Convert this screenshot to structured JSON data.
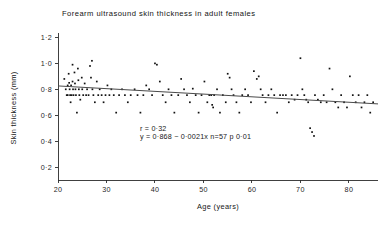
{
  "figure": {
    "title": "Forearm ultrasound skin thickness in adult females",
    "background_color": "#ffffff",
    "ink_color": "#111111"
  },
  "annotations": {
    "line1": "r = 0·32",
    "line2": "y = 0·868 − 0·0021x   n=57  p  0·01"
  },
  "chart_data": {
    "type": "scatter",
    "title": "Forearm ultrasound skin thickness in adult females",
    "xlabel": "Age (years)",
    "ylabel": "Skin thickness (mm)",
    "xlim": [
      20,
      86
    ],
    "ylim": [
      0.1,
      1.25
    ],
    "grid": false,
    "legend": null,
    "xticks": [
      20,
      30,
      40,
      50,
      60,
      70,
      80
    ],
    "xticklabels": [
      "20",
      "30",
      "40",
      "50",
      "60",
      "70",
      "80"
    ],
    "yticks": [
      0.2,
      0.4,
      0.6,
      0.8,
      1.0,
      1.2
    ],
    "yticklabels": [
      "0·2",
      "0·4",
      "0·6",
      "0·8",
      "1·0",
      "1·2"
    ],
    "marker": "dot",
    "n": 57,
    "correlation_r": -0.32,
    "p_value_text": "p 0·01",
    "regression": {
      "intercept": 0.868,
      "slope": -0.0021,
      "equation": "y = 0·868 − 0·0021x",
      "x_start": 20,
      "x_end": 86
    },
    "points": [
      [
        21.3,
        0.88
      ],
      [
        21.6,
        0.8
      ],
      [
        21.8,
        0.755
      ],
      [
        22.0,
        0.83
      ],
      [
        22.0,
        0.755
      ],
      [
        22.2,
        0.92
      ],
      [
        22.3,
        0.85
      ],
      [
        22.4,
        0.8
      ],
      [
        22.5,
        0.755
      ],
      [
        22.6,
        0.7
      ],
      [
        22.7,
        0.83
      ],
      [
        22.8,
        0.755
      ],
      [
        23.0,
        0.99
      ],
      [
        23.0,
        0.86
      ],
      [
        23.1,
        0.8
      ],
      [
        23.2,
        0.755
      ],
      [
        23.4,
        0.93
      ],
      [
        23.5,
        0.845
      ],
      [
        23.6,
        0.8
      ],
      [
        23.7,
        0.755
      ],
      [
        23.9,
        0.62
      ],
      [
        24.1,
        0.96
      ],
      [
        24.2,
        0.87
      ],
      [
        24.3,
        0.8
      ],
      [
        24.4,
        0.755
      ],
      [
        24.6,
        0.72
      ],
      [
        24.9,
        0.89
      ],
      [
        25.0,
        0.8
      ],
      [
        25.2,
        0.755
      ],
      [
        25.5,
        0.845
      ],
      [
        25.8,
        0.755
      ],
      [
        26.0,
        0.8
      ],
      [
        26.3,
        0.755
      ],
      [
        26.6,
        0.98
      ],
      [
        26.8,
        0.89
      ],
      [
        27.0,
        1.02
      ],
      [
        27.1,
        0.8
      ],
      [
        27.3,
        0.755
      ],
      [
        27.6,
        0.7
      ],
      [
        28.0,
        0.86
      ],
      [
        28.3,
        0.755
      ],
      [
        28.6,
        0.8
      ],
      [
        29.0,
        0.755
      ],
      [
        29.4,
        0.7
      ],
      [
        29.8,
        0.755
      ],
      [
        30.2,
        0.83
      ],
      [
        30.6,
        0.755
      ],
      [
        31.0,
        0.8
      ],
      [
        31.5,
        0.755
      ],
      [
        32.0,
        0.62
      ],
      [
        32.6,
        0.755
      ],
      [
        33.2,
        0.8
      ],
      [
        33.8,
        0.755
      ],
      [
        34.4,
        0.7
      ],
      [
        35.0,
        0.755
      ],
      [
        35.8,
        0.8
      ],
      [
        36.4,
        0.755
      ],
      [
        37.0,
        0.62
      ],
      [
        37.6,
        0.755
      ],
      [
        38.2,
        0.83
      ],
      [
        38.8,
        0.8
      ],
      [
        39.4,
        0.755
      ],
      [
        40.0,
        1.0
      ],
      [
        40.4,
        0.99
      ],
      [
        41.0,
        0.86
      ],
      [
        41.6,
        0.755
      ],
      [
        42.2,
        0.7
      ],
      [
        42.8,
        0.8
      ],
      [
        43.4,
        0.755
      ],
      [
        44.0,
        0.62
      ],
      [
        44.8,
        0.755
      ],
      [
        45.4,
        0.88
      ],
      [
        46.0,
        0.8
      ],
      [
        46.6,
        0.755
      ],
      [
        47.2,
        0.7
      ],
      [
        47.8,
        0.805
      ],
      [
        48.4,
        0.755
      ],
      [
        49.0,
        0.62
      ],
      [
        49.6,
        0.755
      ],
      [
        50.2,
        0.86
      ],
      [
        50.8,
        0.7
      ],
      [
        51.2,
        0.755
      ],
      [
        51.6,
        0.755
      ],
      [
        51.8,
        0.68
      ],
      [
        52.0,
        0.66
      ],
      [
        52.2,
        0.755
      ],
      [
        52.8,
        0.8
      ],
      [
        53.4,
        0.62
      ],
      [
        54.0,
        0.755
      ],
      [
        54.6,
        0.7
      ],
      [
        55.0,
        0.92
      ],
      [
        55.4,
        0.89
      ],
      [
        55.8,
        0.8
      ],
      [
        56.2,
        0.755
      ],
      [
        56.8,
        0.7
      ],
      [
        57.4,
        0.62
      ],
      [
        58.0,
        0.755
      ],
      [
        58.6,
        0.8
      ],
      [
        59.2,
        0.755
      ],
      [
        59.8,
        0.7
      ],
      [
        60.4,
        0.94
      ],
      [
        61.0,
        0.88
      ],
      [
        61.4,
        0.9
      ],
      [
        61.8,
        0.8
      ],
      [
        62.2,
        0.755
      ],
      [
        62.8,
        0.7
      ],
      [
        63.4,
        0.755
      ],
      [
        64.0,
        0.8
      ],
      [
        64.6,
        0.755
      ],
      [
        65.2,
        0.62
      ],
      [
        65.8,
        0.755
      ],
      [
        66.4,
        0.755
      ],
      [
        67.0,
        0.755
      ],
      [
        67.6,
        0.7
      ],
      [
        68.2,
        0.755
      ],
      [
        68.8,
        0.72
      ],
      [
        69.4,
        0.755
      ],
      [
        70.0,
        1.04
      ],
      [
        70.4,
        0.8
      ],
      [
        70.8,
        0.755
      ],
      [
        71.2,
        0.72
      ],
      [
        71.6,
        0.7
      ],
      [
        72.0,
        0.5
      ],
      [
        72.4,
        0.47
      ],
      [
        72.8,
        0.44
      ],
      [
        73.0,
        0.755
      ],
      [
        73.6,
        0.72
      ],
      [
        74.2,
        0.7
      ],
      [
        74.8,
        0.755
      ],
      [
        75.4,
        0.7
      ],
      [
        76.0,
        0.96
      ],
      [
        76.6,
        0.8
      ],
      [
        77.2,
        0.7
      ],
      [
        77.8,
        0.66
      ],
      [
        78.4,
        0.755
      ],
      [
        79.0,
        0.7
      ],
      [
        79.6,
        0.66
      ],
      [
        80.2,
        0.9
      ],
      [
        80.8,
        0.755
      ],
      [
        81.4,
        0.7
      ],
      [
        82.0,
        0.755
      ],
      [
        82.6,
        0.66
      ],
      [
        83.2,
        0.7
      ],
      [
        83.8,
        0.755
      ],
      [
        84.4,
        0.62
      ],
      [
        85.0,
        0.7
      ]
    ]
  }
}
